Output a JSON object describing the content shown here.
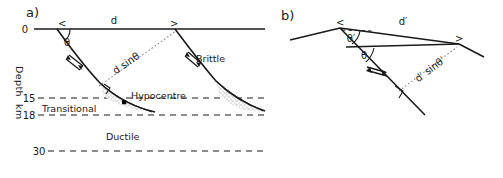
{
  "figure": {
    "background": "#ffffff",
    "line_color": "#1a1a1a",
    "stipple_color": "#5a5a5a",
    "dotted_color": "#8a8a8a"
  },
  "panel_a": {
    "label": "a)",
    "axis": {
      "title_line1": "Depth",
      "title_line2": "km",
      "ticks": [
        {
          "value": "0"
        },
        {
          "value": "15"
        },
        {
          "value": "18"
        },
        {
          "value": "30"
        }
      ]
    },
    "annotations": {
      "distance_label": "d",
      "angle_label": "θ",
      "projection_label": "d sinθ",
      "left_arrow": "<",
      "right_arrow": ">"
    },
    "zones": {
      "brittle": "Brittle",
      "transitional": "Transitional",
      "ductile": "Ductile"
    },
    "hypocentre": {
      "label": "Hypocentre"
    }
  },
  "panel_b": {
    "label": "b)",
    "annotations": {
      "distance_label": "d′",
      "angle_primed_label": "θ′",
      "angle_label": "θ",
      "projection_label": "d′ sinθ′",
      "left_arrow": "<",
      "right_arrow": ">"
    }
  }
}
